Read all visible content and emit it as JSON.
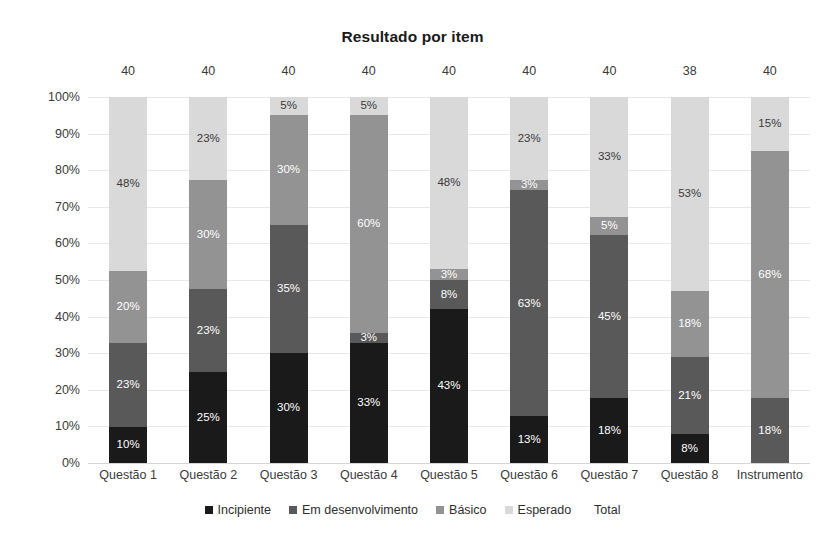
{
  "chart_data": {
    "type": "bar",
    "stacked": true,
    "stack_mode": "percent",
    "title": "Resultado por item",
    "xlabel": "",
    "ylabel": "",
    "ylim": [
      0,
      100
    ],
    "ytick_labels": [
      "100%",
      "90%",
      "80%",
      "70%",
      "60%",
      "50%",
      "40%",
      "30%",
      "20%",
      "10%",
      "0%"
    ],
    "ytick_values": [
      100,
      90,
      80,
      70,
      60,
      50,
      40,
      30,
      20,
      10,
      0
    ],
    "grid": true,
    "legend_position": "bottom",
    "categories": [
      "Questão 1",
      "Questão 2",
      "Questão 3",
      "Questão 4",
      "Questão 5",
      "Questão 6",
      "Questão 7",
      "Questão 8",
      "Instrumento"
    ],
    "series": [
      {
        "name": "Incipiente",
        "color": "#1a1a1a",
        "label_color": "#ffffff",
        "values": [
          10,
          25,
          30,
          33,
          43,
          13,
          18,
          8,
          0
        ],
        "labels": [
          "10%",
          "25%",
          "30%",
          "33%",
          "43%",
          "13%",
          "18%",
          "8%",
          ""
        ]
      },
      {
        "name": "Em desenvolvimento",
        "color": "#595959",
        "label_color": "#ffffff",
        "values": [
          23,
          23,
          35,
          3,
          8,
          63,
          45,
          21,
          18
        ],
        "labels": [
          "23%",
          "23%",
          "35%",
          "3%",
          "8%",
          "63%",
          "45%",
          "21%",
          "18%"
        ]
      },
      {
        "name": "Básico",
        "color": "#939393",
        "label_color": "#ffffff",
        "values": [
          20,
          30,
          30,
          60,
          3,
          3,
          5,
          18,
          68
        ],
        "labels": [
          "20%",
          "30%",
          "30%",
          "60%",
          "3%",
          "3%",
          "5%",
          "18%",
          "68%"
        ]
      },
      {
        "name": "Esperado",
        "color": "#d9d9d9",
        "label_color": "#3a3a3a",
        "values": [
          48,
          23,
          5,
          5,
          48,
          23,
          33,
          53,
          15
        ],
        "labels": [
          "48%",
          "23%",
          "5%",
          "5%",
          "48%",
          "23%",
          "33%",
          "53%",
          "15%"
        ]
      }
    ],
    "totals_series": {
      "name": "Total",
      "values": [
        40,
        40,
        40,
        40,
        40,
        40,
        40,
        38,
        40
      ],
      "labels": [
        "40",
        "40",
        "40",
        "40",
        "40",
        "40",
        "40",
        "38",
        "40"
      ]
    },
    "legend_entries": [
      {
        "label": "Incipiente",
        "color": "#1a1a1a",
        "has_marker": true
      },
      {
        "label": "Em desenvolvimento",
        "color": "#595959",
        "has_marker": true
      },
      {
        "label": "Básico",
        "color": "#939393",
        "has_marker": true
      },
      {
        "label": "Esperado",
        "color": "#d9d9d9",
        "has_marker": true
      },
      {
        "label": "Total",
        "color": "#ffffff",
        "has_marker": false
      }
    ]
  },
  "colors": {
    "background": "#ffffff",
    "gridline": "#e8e8e8",
    "baseline": "#d6d6d6",
    "text": "#3a3a3a",
    "title": "#1a1a1a"
  }
}
